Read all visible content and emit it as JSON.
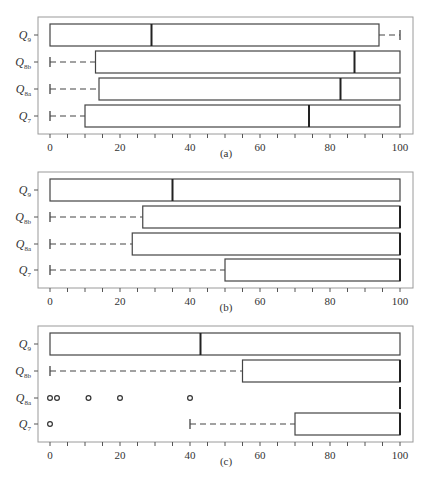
{
  "figure": {
    "panel_labels": [
      "(a)",
      "(b)",
      "(c)"
    ],
    "row_labels": [
      {
        "base": "Q",
        "sub": "9"
      },
      {
        "base": "Q",
        "sub": "8b"
      },
      {
        "base": "Q",
        "sub": "8a"
      },
      {
        "base": "Q",
        "sub": "7"
      }
    ],
    "x_ticks": [
      "0",
      "20",
      "40",
      "60",
      "80",
      "100"
    ]
  },
  "chart_data": [
    {
      "type": "boxplot",
      "title": "(a)",
      "orientation": "horizontal",
      "xlim": [
        0,
        100
      ],
      "x_ticks": [
        0,
        20,
        40,
        60,
        80,
        100
      ],
      "categories": [
        "Q9",
        "Q8b",
        "Q8a",
        "Q7"
      ],
      "series": [
        {
          "name": "Q9",
          "whisker_low": 0,
          "q1": 0,
          "median": 29,
          "q3": 94,
          "whisker_high": 100,
          "outliers": []
        },
        {
          "name": "Q8b",
          "whisker_low": 0,
          "q1": 13,
          "median": 87,
          "q3": 100,
          "whisker_high": 100,
          "outliers": []
        },
        {
          "name": "Q8a",
          "whisker_low": 0,
          "q1": 14,
          "median": 83,
          "q3": 100,
          "whisker_high": 100,
          "outliers": []
        },
        {
          "name": "Q7",
          "whisker_low": 0,
          "q1": 10,
          "median": 74,
          "q3": 100,
          "whisker_high": 100,
          "outliers": []
        }
      ]
    },
    {
      "type": "boxplot",
      "title": "(b)",
      "orientation": "horizontal",
      "xlim": [
        0,
        100
      ],
      "x_ticks": [
        0,
        20,
        40,
        60,
        80,
        100
      ],
      "categories": [
        "Q9",
        "Q8b",
        "Q8a",
        "Q7"
      ],
      "series": [
        {
          "name": "Q9",
          "whisker_low": 0,
          "q1": 0,
          "median": 35,
          "q3": 100,
          "whisker_high": 100,
          "outliers": []
        },
        {
          "name": "Q8b",
          "whisker_low": 0,
          "q1": 26.5,
          "median": 100,
          "q3": 100,
          "whisker_high": 100,
          "outliers": []
        },
        {
          "name": "Q8a",
          "whisker_low": 0,
          "q1": 23.5,
          "median": 100,
          "q3": 100,
          "whisker_high": 100,
          "outliers": []
        },
        {
          "name": "Q7",
          "whisker_low": 0,
          "q1": 50,
          "median": 100,
          "q3": 100,
          "whisker_high": 100,
          "outliers": []
        }
      ]
    },
    {
      "type": "boxplot",
      "title": "(c)",
      "orientation": "horizontal",
      "xlim": [
        0,
        100
      ],
      "x_ticks": [
        0,
        20,
        40,
        60,
        80,
        100
      ],
      "categories": [
        "Q9",
        "Q8b",
        "Q8a",
        "Q7"
      ],
      "series": [
        {
          "name": "Q9",
          "whisker_low": 0,
          "q1": 0,
          "median": 43,
          "q3": 100,
          "whisker_high": 100,
          "outliers": []
        },
        {
          "name": "Q8b",
          "whisker_low": 0,
          "q1": 55,
          "median": 100,
          "q3": 100,
          "whisker_high": 100,
          "outliers": []
        },
        {
          "name": "Q8a",
          "whisker_low": 100,
          "q1": 100,
          "median": 100,
          "q3": 100,
          "whisker_high": 100,
          "outliers": [
            0,
            2,
            11,
            20,
            40
          ]
        },
        {
          "name": "Q7",
          "whisker_low": 40,
          "q1": 70,
          "median": 100,
          "q3": 100,
          "whisker_high": 100,
          "outliers": [
            0
          ]
        }
      ]
    }
  ]
}
